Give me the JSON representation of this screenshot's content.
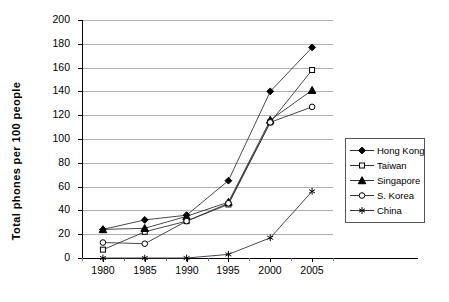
{
  "chart_data": {
    "type": "line",
    "title": "",
    "xlabel": "",
    "ylabel": "Total phones per 100 people",
    "categories": [
      "1980",
      "1985",
      "1990",
      "1995",
      "2000",
      "2005"
    ],
    "ylim": [
      0,
      200
    ],
    "ytick_step": 20,
    "ytick_labels": [
      "0",
      "20",
      "40",
      "60",
      "80",
      "100",
      "120",
      "140",
      "160",
      "180",
      "200"
    ],
    "grid": "horizontal",
    "legend_position": "right",
    "series": [
      {
        "name": "Hong Kong",
        "marker": "filled-diamond",
        "values": [
          24,
          32,
          36,
          65,
          140,
          177
        ]
      },
      {
        "name": "Taiwan",
        "marker": "open-square",
        "values": [
          7,
          22,
          31,
          45,
          114,
          158
        ]
      },
      {
        "name": "Singapore",
        "marker": "filled-triangle",
        "values": [
          24,
          25,
          35,
          47,
          116,
          141
        ]
      },
      {
        "name": "S. Korea",
        "marker": "open-circle",
        "values": [
          13,
          12,
          31,
          46,
          114,
          127
        ]
      },
      {
        "name": "China",
        "marker": "asterisk",
        "values": [
          0,
          0,
          0,
          3,
          17,
          56
        ]
      }
    ]
  },
  "legend": {
    "entries": [
      {
        "label": "Hong Kong"
      },
      {
        "label": "Taiwan"
      },
      {
        "label": "Singapore"
      },
      {
        "label": "S. Korea"
      },
      {
        "label": "China"
      }
    ]
  },
  "colors": {
    "series_line": "#333333",
    "gridline": "#b0b0b0",
    "axis": "#000000",
    "background": "#ffffff"
  }
}
